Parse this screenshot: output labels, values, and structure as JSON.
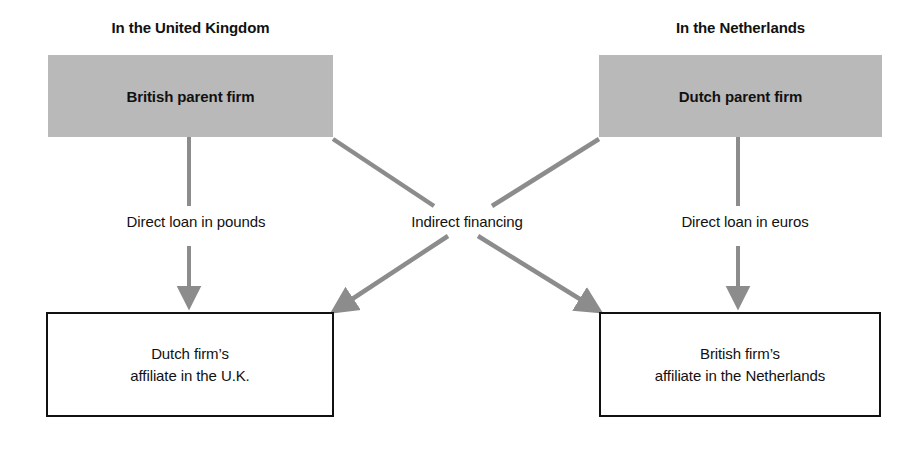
{
  "diagram": {
    "title_uk": "In the United Kingdom",
    "title_nl": "In the Netherlands",
    "colors": {
      "parent_box_fill": "#b9b9b9",
      "affiliate_box_border": "#111111",
      "arrow": "#8c8c8c",
      "text": "#111111",
      "background": "#ffffff"
    },
    "nodes": {
      "british_parent": "British parent firm",
      "dutch_parent": "Dutch parent firm",
      "uk_affiliate_line1": "Dutch firm’s",
      "uk_affiliate_line2": "affiliate in the U.K.",
      "nl_affiliate_line1": "British firm’s",
      "nl_affiliate_line2": "affiliate in the Netherlands"
    },
    "edges": {
      "direct_loan_pounds": "Direct loan in pounds",
      "indirect_financing": "Indirect financing",
      "direct_loan_euros": "Direct loan in euros"
    }
  }
}
